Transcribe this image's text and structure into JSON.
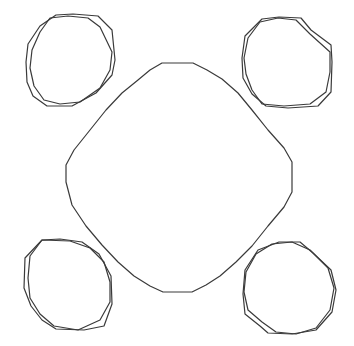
{
  "diagram": {
    "width": 354,
    "height": 346,
    "background": "#ffffff",
    "stroke_color": "#3a3a3a",
    "stroke_width": 1.2,
    "shapes": [
      {
        "name": "center-rounded-square",
        "points": "162,63 193,63 207,70 222,79 238,93 252,110 268,130 284,148 292,162 292,192 284,207 268,226 252,246 236,262 220,276 206,285 192,292 163,292 150,286 134,276 118,262 102,245 86,226 72,205 66,182 66,165 74,150 90,130 106,110 122,93 138,80 150,70"
      },
      {
        "name": "oval-top-left-outer",
        "points": "56,15 73,14 98,16 112,30 115,60 112,75 96,93 72,106 47,106 33,96 27,82 26,62 28,44 40,26"
      },
      {
        "name": "oval-top-left-inner",
        "points": "50,18 68,16 88,18 100,27 112,52 110,70 100,88 80,102 60,104 44,100 34,86 30,68 32,50 40,32"
      },
      {
        "name": "oval-top-right-outer",
        "points": "262,19 279,17 301,18 311,30 331,45 332,62 331,92 318,106 288,108 266,106 252,94 243,78 242,58 245,36"
      },
      {
        "name": "oval-top-right-inner",
        "points": "278,18 296,20 310,34 330,52 330,72 326,92 310,104 284,106 262,104 252,90 246,74 244,58 248,38 260,22"
      },
      {
        "name": "oval-bottom-left-outer",
        "points": "42,240 60,239 82,242 99,254 111,276 112,304 104,326 84,330 56,329 42,320 31,306 24,288 25,258"
      },
      {
        "name": "oval-bottom-left-inner",
        "points": "42,240 70,241 90,248 104,262 110,282 110,302 100,320 78,330 54,326 40,314 30,298 28,278 30,256"
      },
      {
        "name": "oval-bottom-right-outer",
        "points": "279,242 300,242 313,253 331,270 336,290 332,312 316,330 292,334 268,333 260,326 245,314 243,294 245,270 258,250"
      },
      {
        "name": "oval-bottom-right-inner",
        "points": "292,242 310,250 328,268 334,288 330,310 316,328 296,334 276,332 262,322 248,310 244,292 246,272 256,254 272,244"
      }
    ]
  }
}
